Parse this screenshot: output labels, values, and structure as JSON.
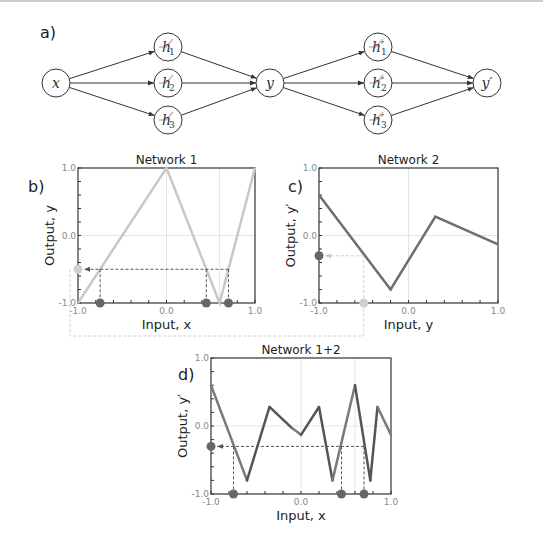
{
  "panel_labels": {
    "a": "a)",
    "b": "b)",
    "c": "c)",
    "d": "d)"
  },
  "diagram": {
    "nodes": [
      {
        "id": "x",
        "label": "x",
        "cx": 56,
        "cy": 83
      },
      {
        "id": "h1",
        "label": "h",
        "sub": "1",
        "prime": false,
        "cx": 168,
        "cy": 47
      },
      {
        "id": "h2",
        "label": "h",
        "sub": "2",
        "prime": false,
        "cx": 168,
        "cy": 83
      },
      {
        "id": "h3",
        "label": "h",
        "sub": "3",
        "prime": false,
        "cx": 168,
        "cy": 120
      },
      {
        "id": "y",
        "label": "y",
        "cx": 270,
        "cy": 83
      },
      {
        "id": "hp1",
        "label": "h",
        "sub": "1",
        "prime": true,
        "cx": 378,
        "cy": 47
      },
      {
        "id": "hp2",
        "label": "h",
        "sub": "2",
        "prime": true,
        "cx": 378,
        "cy": 83
      },
      {
        "id": "hp3",
        "label": "h",
        "sub": "3",
        "prime": true,
        "cx": 378,
        "cy": 120
      },
      {
        "id": "yp",
        "label": "y′",
        "cx": 487,
        "cy": 83
      }
    ],
    "edges": [
      [
        "x",
        "h1"
      ],
      [
        "x",
        "h2"
      ],
      [
        "x",
        "h3"
      ],
      [
        "h1",
        "y"
      ],
      [
        "h2",
        "y"
      ],
      [
        "h3",
        "y"
      ],
      [
        "y",
        "hp1"
      ],
      [
        "y",
        "hp2"
      ],
      [
        "y",
        "hp3"
      ],
      [
        "hp1",
        "yp"
      ],
      [
        "hp2",
        "yp"
      ],
      [
        "hp3",
        "yp"
      ]
    ]
  },
  "chart_data": [
    {
      "type": "line",
      "title": "Network 1",
      "xlabel": "Input, x",
      "ylabel": "Output, y",
      "xlim": [
        -1,
        1
      ],
      "ylim": [
        -1,
        1
      ],
      "xticks": [
        "-1.0",
        "0.0",
        "1.0"
      ],
      "yticks": [
        "-1.0",
        "0.0",
        "1.0"
      ],
      "series": [
        {
          "name": "Network 1",
          "x": [
            -1,
            0,
            0.6,
            1
          ],
          "y": [
            -1,
            1,
            -1,
            1
          ],
          "color": "#c8c8c8"
        }
      ],
      "guides": {
        "y_level": -0.5,
        "x_points": [
          -0.75,
          0.45,
          0.7
        ],
        "vline": 0.6
      }
    },
    {
      "type": "line",
      "title": "Network 2",
      "xlabel": "Input, y",
      "ylabel": "Output, y′",
      "xlim": [
        -1,
        1
      ],
      "ylim": [
        -1,
        1
      ],
      "xticks": [
        "-1.0",
        "0.0",
        "1.0"
      ],
      "yticks": [
        "-1.0",
        "0.0",
        "1.0"
      ],
      "series": [
        {
          "name": "Network 2",
          "x": [
            -1,
            -0.2,
            0.3,
            1
          ],
          "y": [
            0.6,
            -0.8,
            0.28,
            -0.13
          ],
          "color": "#6e6e6e"
        }
      ],
      "guides": {
        "x_input": -0.5,
        "y_output": -0.3
      }
    },
    {
      "type": "line",
      "title": "Network 1+2",
      "xlabel": "Input, x",
      "ylabel": "Output, y′",
      "xlim": [
        -1,
        1
      ],
      "ylim": [
        -1,
        1
      ],
      "xticks": [
        "-1.0",
        "0.0",
        "1.0"
      ],
      "yticks": [
        "-1.0",
        "0.0",
        "1.0"
      ],
      "series": [
        {
          "name": "Network 1+2",
          "x": [
            -1,
            -0.6,
            -0.35,
            -0.1,
            0,
            0.2,
            0.35,
            0.6,
            0.77,
            0.85,
            1
          ],
          "y": [
            0.6,
            -0.8,
            0.28,
            -0.03,
            -0.13,
            0.28,
            -0.8,
            0.6,
            -0.8,
            0.28,
            -0.13
          ],
          "color": "#6e6e6e"
        }
      ],
      "guides": {
        "y_level": -0.3,
        "x_points": [
          -0.75,
          0.45,
          0.7
        ],
        "vline": 0.6
      }
    }
  ]
}
